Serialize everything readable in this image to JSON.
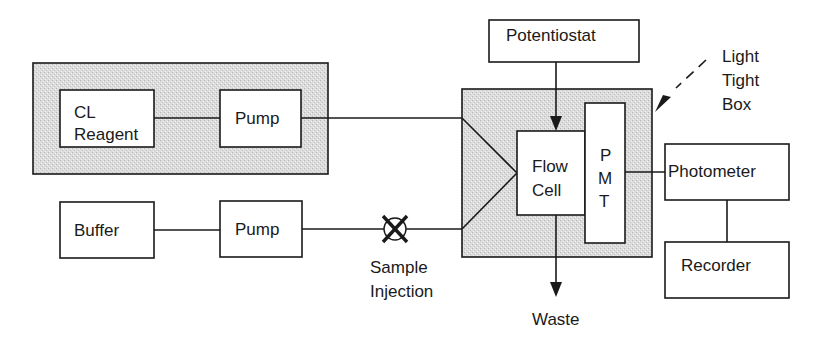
{
  "diagram": {
    "type": "flow-injection chemiluminescence apparatus schematic",
    "colors": {
      "line": "#1a1a1a",
      "shaded_region": "#d6d6d6",
      "box_fill": "#ffffff"
    },
    "nodes": {
      "cl_reagent": {
        "line1": "CL",
        "line2": "Reagent"
      },
      "pump_top": {
        "label": "Pump"
      },
      "buffer": {
        "label": "Buffer"
      },
      "pump_bottom": {
        "label": "Pump"
      },
      "sample_injection": {
        "line1": "Sample",
        "line2": "Injection"
      },
      "potentiostat": {
        "label": "Potentiostat"
      },
      "flow_cell": {
        "line1": "Flow",
        "line2": "Cell"
      },
      "pmt": {
        "letters": [
          "P",
          "M",
          "T"
        ]
      },
      "photometer": {
        "label": "Photometer"
      },
      "recorder": {
        "label": "Recorder"
      },
      "waste": {
        "label": "Waste"
      },
      "light_tight_box": {
        "line1": "Light",
        "line2": "Tight",
        "line3": "Box"
      }
    },
    "edges": [
      {
        "from": "cl_reagent",
        "to": "pump_top"
      },
      {
        "from": "pump_top",
        "to": "flow_cell"
      },
      {
        "from": "buffer",
        "to": "pump_bottom"
      },
      {
        "from": "pump_bottom",
        "to": "sample_injection"
      },
      {
        "from": "sample_injection",
        "to": "flow_cell"
      },
      {
        "from": "potentiostat",
        "to": "flow_cell",
        "arrow": true
      },
      {
        "from": "flow_cell",
        "to": "waste",
        "arrow": true
      },
      {
        "from": "pmt",
        "to": "photometer"
      },
      {
        "from": "photometer",
        "to": "recorder"
      }
    ]
  }
}
